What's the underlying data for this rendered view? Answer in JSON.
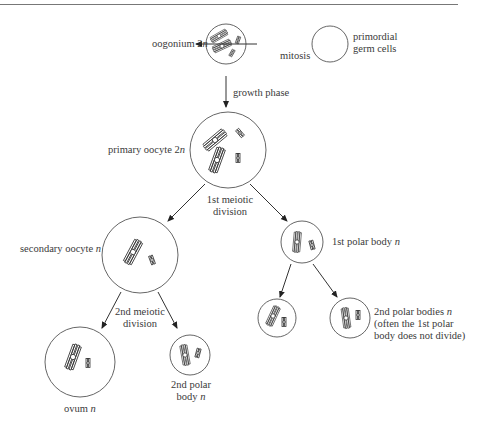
{
  "diagram": {
    "title_rule": true,
    "nodes": {
      "oogonium": {
        "label": "oogonium 2",
        "ploidy": "n"
      },
      "primordial": {
        "label_line1": "primordial",
        "label_line2": "germ cells"
      },
      "primary_oocyte": {
        "label": "primary oocyte 2",
        "ploidy": "n"
      },
      "secondary_oocyte": {
        "label": "secondary oocyte ",
        "ploidy": "n"
      },
      "first_polar_body": {
        "label": "1st polar body ",
        "ploidy": "n"
      },
      "ovum": {
        "label": "ovum ",
        "ploidy": "n"
      },
      "second_polar_body": {
        "label_line1": "2nd polar",
        "label_line2": "body ",
        "ploidy": "n"
      },
      "second_polar_bodies": {
        "label_line1": "2nd polar bodies ",
        "ploidy": "n",
        "label_line2": "(often the 1st polar",
        "label_line3": "body does not divide)"
      }
    },
    "edges": {
      "mitosis": "mitosis",
      "growth": "growth  phase",
      "meiosis1_line1": "1st meiotic",
      "meiosis1_line2": "division",
      "meiosis2_line1": "2nd meiotic",
      "meiosis2_line2": "division"
    }
  }
}
